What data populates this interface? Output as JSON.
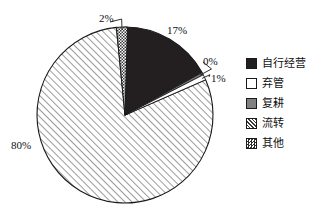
{
  "chart_data": {
    "type": "pie",
    "title": "",
    "subtitle": "",
    "xlabel": "",
    "ylabel": "",
    "grid": false,
    "legend_position": "right",
    "start_angle_deg": 0,
    "direction": "clockwise",
    "categories": [
      "自行经营",
      "弃管",
      "复耕",
      "流转",
      "其他"
    ],
    "values": [
      17,
      1,
      0,
      80,
      2
    ],
    "unit": "%",
    "slice_order_clockwise_from_top": [
      "自行经营",
      "复耕",
      "弃管",
      "流转",
      "其他"
    ],
    "slices": [
      {
        "label": "自行经营",
        "value": 17,
        "display": "17%",
        "fill": "solid-dark",
        "color": "#231f20",
        "label_x": 167,
        "label_y": 25,
        "leader": false
      },
      {
        "label": "复耕",
        "value": 0,
        "display": "0%",
        "fill": "solid-gray",
        "color": "#808080",
        "label_x": 203,
        "label_y": 56,
        "leader": true
      },
      {
        "label": "弃管",
        "value": 1,
        "display": "1%",
        "fill": "white",
        "color": "#ffffff",
        "label_x": 211,
        "label_y": 73,
        "leader": true
      },
      {
        "label": "流转",
        "value": 80,
        "display": "80%",
        "fill": "diagonal-hatch",
        "color": "#ffffff",
        "label_x": 11,
        "label_y": 140,
        "leader": false
      },
      {
        "label": "其他",
        "value": 2,
        "display": "2%",
        "fill": "checker",
        "color": "#ffffff",
        "label_x": 99,
        "label_y": 13,
        "leader": true
      }
    ],
    "legend": [
      {
        "label": "自行经营",
        "fill": "solid-dark",
        "color": "#231f20"
      },
      {
        "label": "弃管",
        "fill": "white",
        "color": "#ffffff"
      },
      {
        "label": "复耕",
        "fill": "solid-gray",
        "color": "#808080"
      },
      {
        "label": "流转",
        "fill": "diagonal-hatch",
        "color": "#ffffff"
      },
      {
        "label": "其他",
        "fill": "checker",
        "color": "#ffffff"
      }
    ],
    "geometry": {
      "center_x": 125,
      "center_y": 115,
      "radius": 88
    },
    "stroke_color": "#1a1a1a"
  }
}
